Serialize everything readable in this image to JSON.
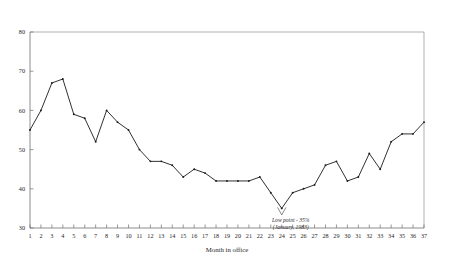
{
  "chart_data": {
    "type": "line",
    "title": "",
    "subtitle": "",
    "xlabel": "Month in office",
    "ylabel": "",
    "xlim": [
      1,
      37
    ],
    "ylim": [
      30,
      80
    ],
    "grid": false,
    "legend": null,
    "x": [
      1,
      2,
      3,
      4,
      5,
      6,
      7,
      8,
      9,
      10,
      11,
      12,
      13,
      14,
      15,
      16,
      17,
      18,
      19,
      20,
      21,
      22,
      23,
      24,
      25,
      26,
      27,
      28,
      29,
      30,
      31,
      32,
      33,
      34,
      35,
      36,
      37
    ],
    "xtick_labels": [
      "1",
      "2",
      "3",
      "4",
      "5",
      "6",
      "7",
      "8",
      "9",
      "10",
      "11",
      "12",
      "13",
      "14",
      "15",
      "16",
      "17",
      "18",
      "19",
      "20",
      "21",
      "22",
      "23",
      "24",
      "25",
      "26",
      "27",
      "28",
      "29",
      "30",
      "31",
      "32",
      "33",
      "34",
      "35",
      "36",
      "37"
    ],
    "ytick_labels": [
      "30",
      "40",
      "50",
      "60",
      "70",
      "80"
    ],
    "yticks": [
      30,
      40,
      50,
      60,
      70,
      80
    ],
    "series": [
      {
        "name": "Approval rating",
        "values": [
          55,
          60,
          67,
          68,
          59,
          58,
          52,
          60,
          57,
          55,
          50,
          47,
          47,
          46,
          43,
          45,
          44,
          42,
          42,
          42,
          42,
          43,
          39,
          35,
          39,
          40,
          41,
          46,
          47,
          42,
          43,
          49,
          45,
          52,
          54,
          54,
          57
        ]
      }
    ],
    "annotations": [
      {
        "name": "low-point",
        "line1": "Low point - 35%",
        "line2": "(January, 1983)",
        "at_x": 24,
        "at_y": 35
      }
    ]
  }
}
